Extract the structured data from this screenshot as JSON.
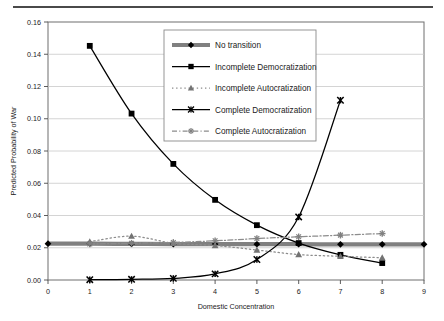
{
  "figure": {
    "divider": "top-horizontal-rule"
  },
  "chart_data": {
    "type": "line",
    "title": "",
    "xlabel": "Domestic Concentration",
    "ylabel": "Predicted Probability of War",
    "xlim": [
      0,
      9
    ],
    "ylim": [
      0.0,
      0.16
    ],
    "xticks": [
      "0",
      "1",
      "2",
      "3",
      "4",
      "5",
      "6",
      "7",
      "8",
      "9"
    ],
    "yticks": [
      "0.00",
      "0.02",
      "0.04",
      "0.06",
      "0.08",
      "0.10",
      "0.12",
      "0.14",
      "0.16"
    ],
    "grid": "horizontal",
    "legend_position": "top-center-inside",
    "x": [
      1,
      2,
      3,
      4,
      5,
      6,
      7,
      8
    ],
    "series": [
      {
        "name": "No transition",
        "marker": "diamond",
        "line_style": "thick-solid",
        "color": "#808080",
        "marker_color": "#000000",
        "values": [
          0.0225,
          0.0224,
          0.0223,
          0.0223,
          0.0222,
          0.0222,
          0.0221,
          0.0221
        ]
      },
      {
        "name": "Incomplete Democratization",
        "marker": "square",
        "line_style": "solid",
        "color": "#000000",
        "marker_color": "#000000",
        "values": [
          0.1452,
          0.1032,
          0.072,
          0.0497,
          0.034,
          0.0229,
          0.0156,
          0.0105
        ]
      },
      {
        "name": "Incomplete Autocratization",
        "marker": "triangle",
        "line_style": "dotted",
        "color": "#8c8c8c",
        "marker_color": "#737373",
        "values": [
          0.0238,
          0.0272,
          0.0228,
          0.0214,
          0.0186,
          0.0158,
          0.0147,
          0.0138
        ]
      },
      {
        "name": "Complete Democratization",
        "marker": "x-cross",
        "line_style": "solid",
        "color": "#000000",
        "marker_color": "#000000",
        "values": [
          0.0002,
          0.0004,
          0.001,
          0.0038,
          0.0127,
          0.0391,
          0.1115,
          null
        ]
      },
      {
        "name": "Complete Autocratization",
        "marker": "starburst",
        "line_style": "dash-dot",
        "color": "#8c8c8c",
        "marker_color": "#808080",
        "values": [
          0.0223,
          0.0228,
          0.0233,
          0.0243,
          0.0257,
          0.0268,
          0.0278,
          0.0288
        ]
      }
    ]
  }
}
